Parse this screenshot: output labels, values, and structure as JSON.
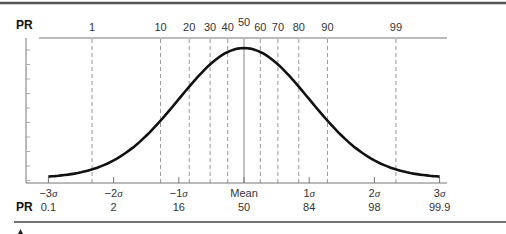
{
  "chart_data": {
    "type": "line",
    "title": "",
    "xlabel": "",
    "ylabel": "",
    "top_axis": {
      "label": "PR",
      "ticks": [
        "1",
        "10",
        "20",
        "30",
        "40",
        "50",
        "60",
        "70",
        "80",
        "90",
        "99"
      ],
      "tick_z": [
        -2.33,
        -1.28,
        -0.84,
        -0.52,
        -0.25,
        0.0,
        0.25,
        0.52,
        0.84,
        1.28,
        2.33
      ]
    },
    "bottom_axis": {
      "sigma_labels": [
        "−3σ",
        "−2σ",
        "−1σ",
        "Mean",
        "1σ",
        "2σ",
        "3σ"
      ],
      "sigma_z": [
        -3,
        -2,
        -1,
        0,
        1,
        2,
        3
      ],
      "pr_label": "PR",
      "pr_values": [
        "0.1",
        "2",
        "16",
        "50",
        "84",
        "98",
        "99.9"
      ]
    },
    "series": [
      {
        "name": "normal-curve",
        "x": [
          -3,
          -2.5,
          -2,
          -1.5,
          -1,
          -0.5,
          0,
          0.5,
          1,
          1.5,
          2,
          2.5,
          3
        ],
        "values": [
          0.004,
          0.018,
          0.054,
          0.13,
          0.242,
          0.352,
          0.399,
          0.352,
          0.242,
          0.13,
          0.054,
          0.018,
          0.004
        ]
      }
    ],
    "xlim": [
      -3,
      3
    ],
    "grid": "dashed vertical lines at percentile ranks",
    "legend": "none"
  },
  "labels": {
    "top_pr": "PR",
    "bottom_pr": "PR",
    "mean": "Mean",
    "sigma_symbol": "σ"
  }
}
